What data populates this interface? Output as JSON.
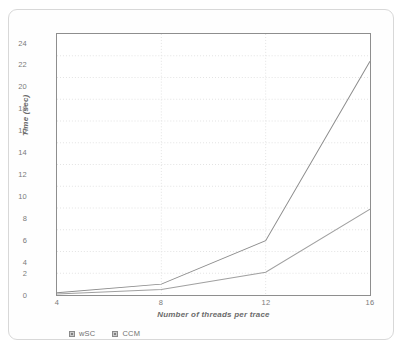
{
  "chart_data": {
    "type": "line",
    "title": "",
    "subtitle": "",
    "xlabel": "Number of threads per trace",
    "ylabel": "Time (sec)",
    "x": [
      4,
      8,
      12,
      16
    ],
    "xtick_labels": [
      "4",
      "8",
      "12",
      "16"
    ],
    "ytick_labels": [
      "0",
      "2",
      "4",
      "6",
      "8",
      "10",
      "12",
      "14",
      "16",
      "18",
      "20",
      "22",
      "24"
    ],
    "yticks": [
      0,
      2,
      4,
      6,
      8,
      10,
      12,
      14,
      16,
      18,
      20,
      22,
      24
    ],
    "xlim": [
      4,
      16
    ],
    "ylim": [
      0,
      24
    ],
    "grid": true,
    "grid_axis": "y",
    "legend_position": "bottom-left",
    "series": [
      {
        "name": "wSC",
        "values": [
          0.2,
          1.0,
          5.0,
          21.5
        ],
        "color": "#8c8c8c"
      },
      {
        "name": "CCM",
        "values": [
          0.1,
          0.5,
          2.1,
          7.9
        ],
        "color": "#a0a0a0"
      }
    ]
  },
  "axes": {
    "x_title": "Number of threads per trace",
    "y_title": "Time (sec)",
    "frame_color": "#8e8e8e",
    "grid_color": "#e3e3e3"
  },
  "legend": {
    "items": [
      {
        "label": "wSC"
      },
      {
        "label": "CCM"
      }
    ]
  }
}
